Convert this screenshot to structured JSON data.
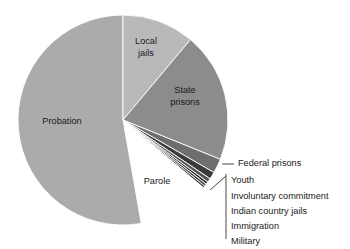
{
  "chart_data": {
    "type": "pie",
    "title": "",
    "subtitle": "",
    "xlabel": "",
    "ylabel": "",
    "legend_position": "none",
    "grid": false,
    "units": "share of total correctional population",
    "categories": [
      "Probation",
      "Local jails",
      "State prisons",
      "Federal prisons",
      "Youth",
      "Involuntary commitment",
      "Indian country jails",
      "Immigration",
      "Military"
    ],
    "values": [
      52.8,
      11.1,
      20.0,
      2.2,
      1.1,
      0.6,
      0.4,
      0.4,
      0.3
    ],
    "angles_deg": [
      190.0,
      40.0,
      72.0,
      8.0,
      4.0,
      2.2,
      1.4,
      1.4,
      1.0
    ],
    "colors": [
      "#ababab",
      "#b9b9b9",
      "#8c8c8c",
      "#6e6e6e",
      "#3a3a3a",
      "#555555",
      "#2a2a2a",
      "#4a4a4a",
      "#1e1e1e"
    ],
    "slice_label_placement": "inside-for-large-slices, callout-for-small-slices"
  },
  "pie": {
    "center_x": 123,
    "center_y": 120,
    "radius": 105,
    "start_angle_deg": 0,
    "direction": "clockwise-from-top-for-small-slices"
  },
  "inside_labels": [
    {
      "key": "probation",
      "text": "Probation",
      "x": 62,
      "y": 122,
      "lines": [
        "Probation"
      ]
    },
    {
      "key": "local_jails",
      "text": "Local jails",
      "x": 146,
      "y": 48,
      "lines": [
        "Local",
        "jails"
      ]
    },
    {
      "key": "state_prisons",
      "text": "State prisons",
      "x": 185,
      "y": 97,
      "lines": [
        "State",
        "prisons"
      ]
    },
    {
      "key": "parole",
      "text": "Parole",
      "x": 157,
      "y": 182,
      "lines": [
        "Parole"
      ]
    }
  ],
  "callouts": {
    "federal_prisons": {
      "label": "Federal prisons",
      "text_x": 238,
      "text_y": 164,
      "leader_x1": 222,
      "leader_y1": 164,
      "leader_x2": 234,
      "leader_y2": 164
    },
    "bracket_group": {
      "items": [
        {
          "key": "youth",
          "label": "Youth"
        },
        {
          "key": "involuntary_commitment",
          "label": "Involuntary commitment"
        },
        {
          "key": "indian_country_jails",
          "label": "Indian country jails"
        },
        {
          "key": "immigration",
          "label": "Immigration"
        },
        {
          "key": "military",
          "label": "Military"
        }
      ],
      "text_x": 231,
      "first_y": 181,
      "line_height": 15.2,
      "bracket_x": 226,
      "bracket_top": 174,
      "bracket_bottom": 239,
      "connector_x1": 210,
      "connector_y1": 190,
      "connector_x2": 226,
      "connector_y2": 176
    }
  },
  "colors": {
    "background": "#ffffff",
    "text": "#1a1a1a",
    "leader_line": "#4a4a4a",
    "slice_separator": "#ffffff"
  }
}
